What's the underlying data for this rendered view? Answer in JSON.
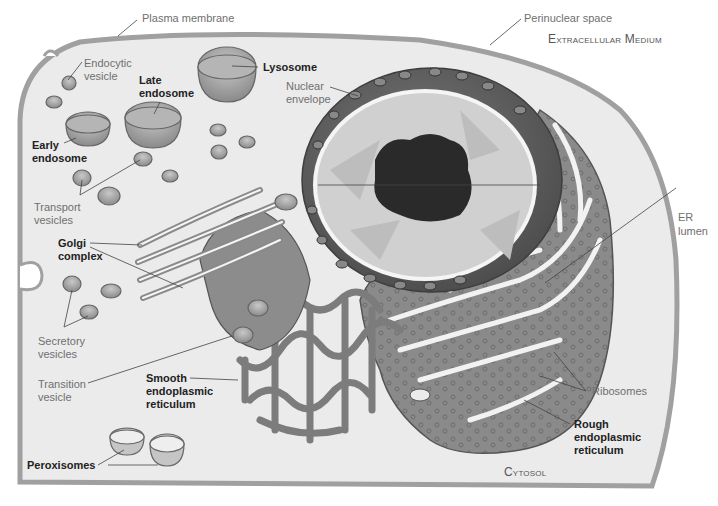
{
  "figure": {
    "regions": {
      "extracellular": "Extracellular Medium",
      "cytosol": "Cytosol"
    },
    "labels": {
      "plasma_membrane": "Plasma membrane",
      "endocytic_vesicle_1": "Endocytic",
      "endocytic_vesicle_2": "vesicle",
      "late_endosome_1": "Late",
      "late_endosome_2": "endosome",
      "lysosome": "Lysosome",
      "early_endosome_1": "Early",
      "early_endosome_2": "endosome",
      "nuclear_envelope_1": "Nuclear",
      "nuclear_envelope_2": "envelope",
      "perinuclear_space": "Perinuclear space",
      "transport_vesicles_1": "Transport",
      "transport_vesicles_2": "vesicles",
      "golgi_1": "Golgi",
      "golgi_2": "complex",
      "er_lumen_1": "ER",
      "er_lumen_2": "lumen",
      "secretory_vesicles_1": "Secretory",
      "secretory_vesicles_2": "vesicles",
      "transition_vesicle_1": "Transition",
      "transition_vesicle_2": "vesicle",
      "smooth_er_1": "Smooth",
      "smooth_er_2": "endoplasmic",
      "smooth_er_3": "reticulum",
      "ribosomes": "Ribosomes",
      "rough_er_1": "Rough",
      "rough_er_2": "endoplasmic",
      "rough_er_3": "reticulum",
      "peroxisomes": "Peroxisomes"
    },
    "colors": {
      "cytosol": "#ebebeb",
      "membrane": "#9a9a9a",
      "organelle": "#8e8e8e",
      "organelle_dark": "#6e6e6e",
      "nucleus_light": "#d2d2d2",
      "nucleolus": "#2a2a2a",
      "text_regular": "#6f6f6f",
      "text_bold": "#222222"
    }
  }
}
